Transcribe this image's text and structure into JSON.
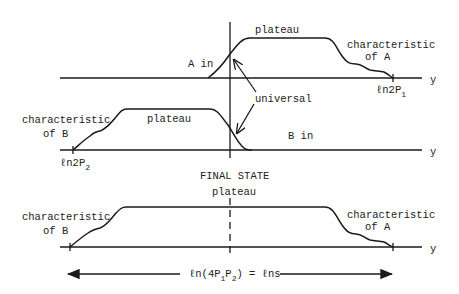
{
  "diagram": {
    "panel_top": {
      "axis_label": "y",
      "label_plateau": "plateau",
      "label_a_in": "A in",
      "label_char_line1": "characteristic",
      "label_char_line2": "of A",
      "label_endpoint_main": "ℓn2P",
      "label_endpoint_sub": "1"
    },
    "panel_middle": {
      "axis_label": "y",
      "label_plateau": "plateau",
      "label_b_in": "B in",
      "label_char_line1": "characteristic",
      "label_char_line2": "of B",
      "label_endpoint_main": "ℓn2P",
      "label_endpoint_sub": "2"
    },
    "shared": {
      "label_universal": "universal"
    },
    "final_state": {
      "title": "FINAL STATE",
      "label_plateau": "plateau",
      "axis_label": "y",
      "label_char_b_line1": "characteristic",
      "label_char_b_line2": "of B",
      "label_char_a_line1": "characteristic",
      "label_char_a_line2": "of A"
    },
    "width_annotation": {
      "prefix": "ℓn(4P",
      "sub1": "1",
      "mid": "P",
      "sub2": "2",
      "suffix": ") = ℓns"
    }
  }
}
